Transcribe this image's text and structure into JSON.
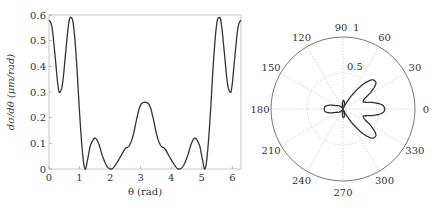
{
  "chart_data": [
    {
      "type": "line",
      "title": "",
      "xlabel": "θ (rad)",
      "ylabel": "dσ/dθ (μm/rad)",
      "xlim": [
        0,
        6.2832
      ],
      "ylim": [
        0,
        0.6
      ],
      "xticks": [
        "0",
        "1",
        "2",
        "3",
        "4",
        "5",
        "6"
      ],
      "yticks": [
        "0",
        "0.1",
        "0.2",
        "0.3",
        "0.4",
        "0.5",
        "0.6"
      ],
      "grid": false,
      "symmetry": "symmetric about θ = π (values for θ > π mirror θ < π)",
      "series": [
        {
          "name": "dσ/dθ",
          "x": [
            0,
            0.1,
            0.2,
            0.3,
            0.36,
            0.45,
            0.55,
            0.65,
            0.72,
            0.8,
            0.9,
            1.0,
            1.1,
            1.18,
            1.25,
            1.35,
            1.5,
            1.62,
            1.75,
            1.9,
            2.05,
            2.2,
            2.35,
            2.5,
            2.62,
            2.75,
            2.9,
            3.0,
            3.1416
          ],
          "y": [
            0.58,
            0.55,
            0.44,
            0.32,
            0.3,
            0.34,
            0.46,
            0.57,
            0.59,
            0.56,
            0.42,
            0.22,
            0.06,
            0.0,
            0.03,
            0.09,
            0.12,
            0.1,
            0.05,
            0.01,
            0.0,
            0.02,
            0.05,
            0.08,
            0.09,
            0.13,
            0.21,
            0.25,
            0.26
          ]
        }
      ]
    },
    {
      "type": "polar",
      "title": "",
      "angle_ticks": [
        "0",
        "30",
        "60",
        "90",
        "120",
        "150",
        "180",
        "210",
        "240",
        "270",
        "300",
        "330"
      ],
      "radial_ticks": [
        "0.5",
        "1"
      ],
      "rlim": [
        0,
        1
      ],
      "grid": true,
      "series": [
        {
          "name": "dσ/dθ (polar)",
          "same_data_as": "chart 1"
        }
      ]
    }
  ]
}
